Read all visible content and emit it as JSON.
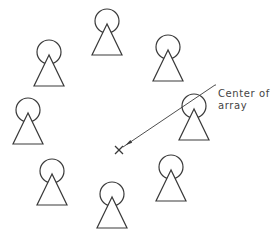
{
  "diagram": {
    "annotation": {
      "line1": "Center of",
      "line2": "array"
    },
    "center": {
      "x": 119,
      "y": 150,
      "marker": "x-cross-icon"
    },
    "leader": {
      "from": [
        123,
        147
      ],
      "to": [
        215,
        85
      ]
    },
    "stroke_color": "#3a3a3a",
    "symbol": {
      "shape": "circle-with-triangle",
      "circle_radius": 12,
      "triangle_height": 31,
      "triangle_half_width": 15
    },
    "symbols": [
      {
        "name": "top",
        "cx": 107,
        "cy": 21
      },
      {
        "name": "top-right",
        "cx": 168,
        "cy": 47
      },
      {
        "name": "right",
        "cx": 194,
        "cy": 106
      },
      {
        "name": "bottom-right",
        "cx": 171,
        "cy": 167
      },
      {
        "name": "bottom",
        "cx": 112,
        "cy": 194
      },
      {
        "name": "bottom-left",
        "cx": 52,
        "cy": 171
      },
      {
        "name": "left",
        "cx": 28,
        "cy": 110
      },
      {
        "name": "top-left",
        "cx": 49,
        "cy": 52
      }
    ]
  }
}
